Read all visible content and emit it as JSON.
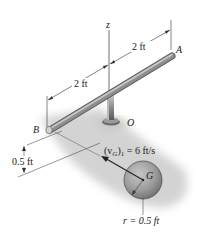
{
  "diagram": {
    "axis_label": "z",
    "points": {
      "A": "A",
      "B": "B",
      "O": "O",
      "G": "G"
    },
    "dimensions": {
      "OA_length": "2 ft",
      "OB_length": "2 ft",
      "drop_height": "0.5 ft",
      "radius": "r = 0.5 ft"
    },
    "velocity": {
      "symbol": "(v",
      "subscript_G": "G",
      "close": ")",
      "subscript_1": "1",
      "value": " = 6 ft/s"
    },
    "colors": {
      "rod": "#8a8a8a",
      "rod_highlight": "#c4c4c4",
      "ball": "#9a9a9a",
      "shadow": "#cfcfcf",
      "line": "#333333"
    }
  }
}
